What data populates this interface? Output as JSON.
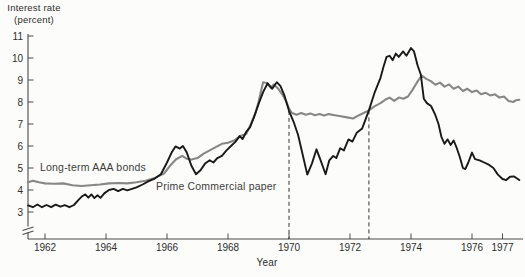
{
  "figure": {
    "y_axis_title_line1": "Interest rate",
    "y_axis_title_line2": "(percent)",
    "x_axis_title": "Year"
  },
  "colors": {
    "background": "#fcfcfa",
    "axis": "#4a4a4a",
    "text": "#2d2d2d",
    "aaa_bonds_line": "#878787",
    "commercial_paper_line": "#191919",
    "dashed_reference": "#333333"
  },
  "chart_data": {
    "type": "line",
    "title": "Interest rate (percent)",
    "xlabel": "Year",
    "ylabel": "Interest rate (percent)",
    "xlim": [
      1961.4,
      1977.7
    ],
    "ylim": [
      3,
      11
    ],
    "y_axis_break_below": 3,
    "grid": false,
    "legend": "inline labels next to curves",
    "x_ticks": [
      1962,
      1964,
      1966,
      1968,
      1970,
      1972,
      1974,
      1976,
      1977
    ],
    "y_ticks": [
      3,
      4,
      5,
      6,
      7,
      8,
      9,
      10,
      11
    ],
    "vlines": [
      {
        "x": 1970.0,
        "from_value": 7.6,
        "style": "dashed"
      },
      {
        "x": 1972.62,
        "from_value": 7.62,
        "style": "dashed"
      }
    ],
    "series": [
      {
        "name": "Long-term AAA bonds",
        "color": "#878787",
        "width": 2.1,
        "points": [
          [
            1961.45,
            4.35
          ],
          [
            1961.6,
            4.42
          ],
          [
            1961.8,
            4.35
          ],
          [
            1962.0,
            4.3
          ],
          [
            1962.3,
            4.28
          ],
          [
            1962.6,
            4.3
          ],
          [
            1962.9,
            4.22
          ],
          [
            1963.2,
            4.18
          ],
          [
            1963.5,
            4.22
          ],
          [
            1963.8,
            4.25
          ],
          [
            1964.1,
            4.3
          ],
          [
            1964.4,
            4.32
          ],
          [
            1964.7,
            4.3
          ],
          [
            1965.0,
            4.35
          ],
          [
            1965.3,
            4.42
          ],
          [
            1965.6,
            4.55
          ],
          [
            1965.9,
            4.75
          ],
          [
            1966.1,
            5.1
          ],
          [
            1966.3,
            5.4
          ],
          [
            1966.5,
            5.55
          ],
          [
            1966.65,
            5.42
          ],
          [
            1966.8,
            5.38
          ],
          [
            1967.0,
            5.45
          ],
          [
            1967.2,
            5.65
          ],
          [
            1967.4,
            5.8
          ],
          [
            1967.6,
            5.95
          ],
          [
            1967.8,
            6.1
          ],
          [
            1968.0,
            6.15
          ],
          [
            1968.2,
            6.25
          ],
          [
            1968.4,
            6.45
          ],
          [
            1968.6,
            6.55
          ],
          [
            1968.75,
            7.0
          ],
          [
            1968.9,
            7.5
          ],
          [
            1969.0,
            8.0
          ],
          [
            1969.15,
            8.9
          ],
          [
            1969.3,
            8.85
          ],
          [
            1969.4,
            8.65
          ],
          [
            1969.5,
            8.8
          ],
          [
            1969.65,
            8.6
          ],
          [
            1969.8,
            8.3
          ],
          [
            1969.9,
            8.05
          ],
          [
            1970.0,
            7.7
          ],
          [
            1970.1,
            7.5
          ],
          [
            1970.25,
            7.42
          ],
          [
            1970.4,
            7.5
          ],
          [
            1970.55,
            7.42
          ],
          [
            1970.7,
            7.48
          ],
          [
            1970.85,
            7.4
          ],
          [
            1971.0,
            7.45
          ],
          [
            1971.15,
            7.38
          ],
          [
            1971.3,
            7.45
          ],
          [
            1971.5,
            7.4
          ],
          [
            1971.7,
            7.35
          ],
          [
            1971.9,
            7.3
          ],
          [
            1972.1,
            7.25
          ],
          [
            1972.3,
            7.4
          ],
          [
            1972.62,
            7.62
          ],
          [
            1972.8,
            7.8
          ],
          [
            1973.0,
            7.95
          ],
          [
            1973.15,
            8.1
          ],
          [
            1973.3,
            8.2
          ],
          [
            1973.45,
            8.05
          ],
          [
            1973.6,
            8.2
          ],
          [
            1973.75,
            8.15
          ],
          [
            1973.9,
            8.25
          ],
          [
            1974.05,
            8.55
          ],
          [
            1974.2,
            8.9
          ],
          [
            1974.35,
            9.2
          ],
          [
            1974.5,
            9.05
          ],
          [
            1974.65,
            8.95
          ],
          [
            1974.8,
            8.78
          ],
          [
            1974.95,
            8.88
          ],
          [
            1975.1,
            8.7
          ],
          [
            1975.25,
            8.8
          ],
          [
            1975.4,
            8.6
          ],
          [
            1975.55,
            8.7
          ],
          [
            1975.7,
            8.5
          ],
          [
            1975.85,
            8.6
          ],
          [
            1976.0,
            8.45
          ],
          [
            1976.15,
            8.52
          ],
          [
            1976.3,
            8.35
          ],
          [
            1976.45,
            8.42
          ],
          [
            1976.6,
            8.3
          ],
          [
            1976.75,
            8.35
          ],
          [
            1976.9,
            8.2
          ],
          [
            1977.05,
            8.25
          ],
          [
            1977.2,
            8.05
          ],
          [
            1977.35,
            8.0
          ],
          [
            1977.45,
            8.08
          ],
          [
            1977.55,
            8.1
          ]
        ]
      },
      {
        "name": "Prime Commercial paper",
        "color": "#191919",
        "width": 1.9,
        "points": [
          [
            1961.45,
            3.3
          ],
          [
            1961.6,
            3.22
          ],
          [
            1961.75,
            3.34
          ],
          [
            1961.9,
            3.22
          ],
          [
            1962.05,
            3.32
          ],
          [
            1962.2,
            3.22
          ],
          [
            1962.35,
            3.33
          ],
          [
            1962.5,
            3.24
          ],
          [
            1962.65,
            3.31
          ],
          [
            1962.8,
            3.22
          ],
          [
            1962.95,
            3.32
          ],
          [
            1963.1,
            3.55
          ],
          [
            1963.22,
            3.72
          ],
          [
            1963.32,
            3.8
          ],
          [
            1963.42,
            3.65
          ],
          [
            1963.52,
            3.8
          ],
          [
            1963.62,
            3.63
          ],
          [
            1963.72,
            3.76
          ],
          [
            1963.82,
            3.64
          ],
          [
            1963.95,
            3.86
          ],
          [
            1964.1,
            4.0
          ],
          [
            1964.25,
            4.05
          ],
          [
            1964.4,
            3.95
          ],
          [
            1964.55,
            4.05
          ],
          [
            1964.7,
            3.98
          ],
          [
            1964.85,
            4.05
          ],
          [
            1965.0,
            4.12
          ],
          [
            1965.2,
            4.25
          ],
          [
            1965.4,
            4.4
          ],
          [
            1965.6,
            4.52
          ],
          [
            1965.8,
            4.72
          ],
          [
            1966.0,
            5.25
          ],
          [
            1966.15,
            5.7
          ],
          [
            1966.28,
            5.98
          ],
          [
            1966.42,
            5.88
          ],
          [
            1966.52,
            6.0
          ],
          [
            1966.65,
            5.7
          ],
          [
            1966.8,
            5.1
          ],
          [
            1966.95,
            4.72
          ],
          [
            1967.1,
            4.9
          ],
          [
            1967.25,
            5.2
          ],
          [
            1967.4,
            5.35
          ],
          [
            1967.52,
            5.25
          ],
          [
            1967.65,
            5.45
          ],
          [
            1967.8,
            5.55
          ],
          [
            1967.95,
            5.8
          ],
          [
            1968.1,
            6.0
          ],
          [
            1968.25,
            6.2
          ],
          [
            1968.38,
            6.45
          ],
          [
            1968.48,
            6.32
          ],
          [
            1968.6,
            6.65
          ],
          [
            1968.72,
            6.85
          ],
          [
            1968.85,
            7.3
          ],
          [
            1969.0,
            7.9
          ],
          [
            1969.15,
            8.45
          ],
          [
            1969.3,
            8.85
          ],
          [
            1969.45,
            8.6
          ],
          [
            1969.6,
            8.9
          ],
          [
            1969.72,
            8.72
          ],
          [
            1969.85,
            8.3
          ],
          [
            1970.0,
            7.6
          ],
          [
            1970.15,
            7.1
          ],
          [
            1970.3,
            6.5
          ],
          [
            1970.45,
            5.6
          ],
          [
            1970.6,
            4.7
          ],
          [
            1970.75,
            5.2
          ],
          [
            1970.9,
            5.85
          ],
          [
            1971.05,
            5.3
          ],
          [
            1971.2,
            4.72
          ],
          [
            1971.32,
            5.35
          ],
          [
            1971.45,
            5.55
          ],
          [
            1971.55,
            5.45
          ],
          [
            1971.68,
            5.9
          ],
          [
            1971.8,
            5.8
          ],
          [
            1971.95,
            6.3
          ],
          [
            1972.08,
            6.2
          ],
          [
            1972.22,
            6.6
          ],
          [
            1972.4,
            6.8
          ],
          [
            1972.62,
            7.62
          ],
          [
            1972.8,
            8.4
          ],
          [
            1973.0,
            9.1
          ],
          [
            1973.1,
            9.6
          ],
          [
            1973.2,
            10.05
          ],
          [
            1973.3,
            10.1
          ],
          [
            1973.4,
            9.9
          ],
          [
            1973.5,
            10.2
          ],
          [
            1973.6,
            10.05
          ],
          [
            1973.74,
            10.3
          ],
          [
            1973.85,
            10.1
          ],
          [
            1974.0,
            10.45
          ],
          [
            1974.1,
            10.3
          ],
          [
            1974.22,
            9.65
          ],
          [
            1974.32,
            9.25
          ],
          [
            1974.42,
            8.15
          ],
          [
            1974.52,
            7.95
          ],
          [
            1974.66,
            7.82
          ],
          [
            1974.8,
            7.4
          ],
          [
            1974.9,
            7.0
          ],
          [
            1975.0,
            6.4
          ],
          [
            1975.1,
            6.1
          ],
          [
            1975.2,
            6.3
          ],
          [
            1975.3,
            6.05
          ],
          [
            1975.4,
            6.25
          ],
          [
            1975.5,
            5.9
          ],
          [
            1975.6,
            5.5
          ],
          [
            1975.7,
            5.0
          ],
          [
            1975.78,
            4.95
          ],
          [
            1975.88,
            5.25
          ],
          [
            1976.0,
            5.7
          ],
          [
            1976.1,
            5.4
          ],
          [
            1976.25,
            5.35
          ],
          [
            1976.4,
            5.25
          ],
          [
            1976.55,
            5.15
          ],
          [
            1976.7,
            5.0
          ],
          [
            1976.85,
            4.7
          ],
          [
            1977.0,
            4.5
          ],
          [
            1977.12,
            4.45
          ],
          [
            1977.25,
            4.6
          ],
          [
            1977.38,
            4.62
          ],
          [
            1977.55,
            4.45
          ]
        ]
      }
    ]
  }
}
